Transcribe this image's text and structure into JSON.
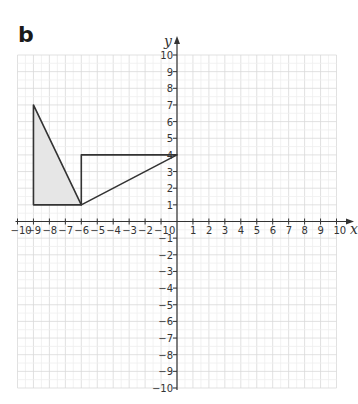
{
  "figure": {
    "panel_label": "b",
    "x_axis_label": "x",
    "y_axis_label": "y"
  },
  "chart_data": {
    "type": "coordinate-grid",
    "title": "b",
    "xlabel": "x",
    "ylabel": "y",
    "xlim": [
      -10,
      10
    ],
    "ylim": [
      -10,
      10
    ],
    "x_ticks": [
      -10,
      -9,
      -8,
      -7,
      -6,
      -5,
      -4,
      -3,
      -2,
      -1,
      0,
      1,
      2,
      3,
      4,
      5,
      6,
      7,
      8,
      9,
      10
    ],
    "y_ticks": [
      -10,
      -9,
      -8,
      -7,
      -6,
      -5,
      -4,
      -3,
      -2,
      -1,
      1,
      2,
      3,
      4,
      5,
      6,
      7,
      8,
      9,
      10
    ],
    "grid": true,
    "shapes": [
      {
        "name": "shaded-triangle",
        "fill": "#e6e6e6",
        "stroke": "#333333",
        "points": [
          [
            -9,
            1
          ],
          [
            -9,
            7
          ],
          [
            -6,
            1
          ]
        ]
      },
      {
        "name": "image-triangle",
        "fill": "none",
        "stroke": "#333333",
        "points": [
          [
            -6,
            1
          ],
          [
            -6,
            4
          ],
          [
            0,
            4
          ]
        ]
      }
    ]
  },
  "colors": {
    "grid": "#d9d9d9",
    "axis": "#333333",
    "shape_stroke": "#333333",
    "shade": "#e6e6e6"
  }
}
